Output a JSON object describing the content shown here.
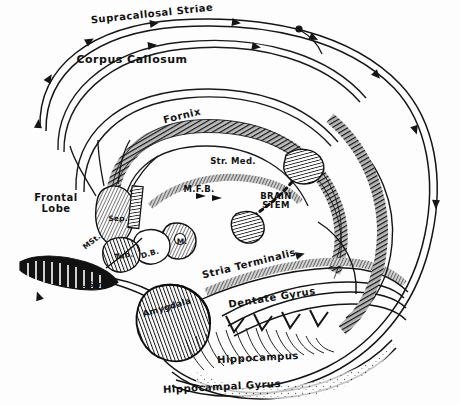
{
  "figure": {
    "background_color": "#fdfdfd",
    "ink_color": "#121212"
  },
  "labels": [
    {
      "id": "supracallosal-striae",
      "text": "Supracallosal Striae",
      "x": 152,
      "y": 8,
      "size": "md",
      "rotate": -6
    },
    {
      "id": "corpus-callosum",
      "text": "Corpus Callosum",
      "x": 132,
      "y": 54,
      "size": "lg",
      "rotate": 0
    },
    {
      "id": "fornix",
      "text": "Fornix",
      "x": 182,
      "y": 110,
      "size": "md",
      "rotate": -14
    },
    {
      "id": "str-med",
      "text": "Str. Med.",
      "x": 233,
      "y": 157,
      "size": "sm",
      "rotate": 0
    },
    {
      "id": "mfb",
      "text": "M.F.B.",
      "x": 199,
      "y": 185,
      "size": "sm",
      "rotate": 0
    },
    {
      "id": "brain-stem",
      "text": "BRAIN\nSTEM",
      "x": 276,
      "y": 192,
      "size": "sm",
      "rotate": 0
    },
    {
      "id": "frontal-lobe",
      "text": "Frontal\nLobe",
      "x": 56,
      "y": 192,
      "size": "md",
      "rotate": 0
    },
    {
      "id": "septum",
      "text": "Sep.",
      "x": 118,
      "y": 215,
      "size": "xs",
      "rotate": 0
    },
    {
      "id": "medial-striae",
      "text": "MSt.",
      "x": 92,
      "y": 238,
      "size": "xs",
      "rotate": -38
    },
    {
      "id": "tuber",
      "text": "Tub.",
      "x": 124,
      "y": 252,
      "size": "xs",
      "rotate": -10
    },
    {
      "id": "diagonal-band",
      "text": "D.B.",
      "x": 150,
      "y": 250,
      "size": "xs",
      "rotate": -16
    },
    {
      "id": "mammillary-body",
      "text": "M.",
      "x": 182,
      "y": 238,
      "size": "xs",
      "rotate": 0
    },
    {
      "id": "lateral-striae",
      "text": "L Str.",
      "x": 92,
      "y": 281,
      "size": "xs",
      "rotate": 0
    },
    {
      "id": "amygdala",
      "text": "Amygdala",
      "x": 167,
      "y": 303,
      "size": "sm",
      "rotate": -16
    },
    {
      "id": "stria-terminalis",
      "text": "Stria Terminalis",
      "x": 249,
      "y": 258,
      "size": "md",
      "rotate": -14
    },
    {
      "id": "dentate-gyrus",
      "text": "Dentate Gyrus",
      "x": 272,
      "y": 292,
      "size": "md",
      "rotate": -9
    },
    {
      "id": "hippocampus",
      "text": "Hippocampus",
      "x": 258,
      "y": 352,
      "size": "md",
      "rotate": -3
    },
    {
      "id": "hippocampal-gyrus",
      "text": "Hippocampal Gyrus",
      "x": 222,
      "y": 381,
      "size": "md",
      "rotate": -3
    }
  ],
  "structures": [
    {
      "id": "callosal-outer-arc",
      "name": "corpus-callosum-outer-arc"
    },
    {
      "id": "callosal-inner-arc",
      "name": "corpus-callosum-inner-arc"
    },
    {
      "id": "fornix-band",
      "name": "fornix-hatched-band"
    },
    {
      "id": "stria-medullaris",
      "name": "stria-medullaris-band"
    },
    {
      "id": "stria-terminalis-band",
      "name": "stria-terminalis-band"
    },
    {
      "id": "temporal-lobe-outline",
      "name": "temporal-lobe-outline"
    },
    {
      "id": "amygdala-body",
      "name": "amygdala-nucleus"
    },
    {
      "id": "mammillary-body-shape",
      "name": "mammillary-body"
    },
    {
      "id": "habenula-shape",
      "name": "habenular-nucleus"
    },
    {
      "id": "interpeduncular",
      "name": "interpeduncular-nucleus"
    },
    {
      "id": "septal-shape",
      "name": "septal-area"
    },
    {
      "id": "olfactory-bulb",
      "name": "olfactory-bulb-tract"
    },
    {
      "id": "dentate-gyrus-band",
      "name": "dentate-gyrus-band"
    },
    {
      "id": "hippocampus-fibers",
      "name": "hippocampal-fiber-hatching"
    }
  ],
  "arrowheads": {
    "count": 4,
    "direction": "left"
  }
}
